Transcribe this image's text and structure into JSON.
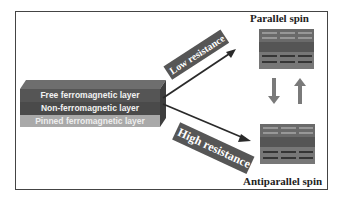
{
  "layers": {
    "free": "Free ferromagnetic layer",
    "non": "Non-ferromagnetic layer",
    "pinned": "Pinned ferromagnetic layer"
  },
  "paths": {
    "low": "Low resistance",
    "high": "High resistance"
  },
  "states": {
    "parallel": "Parallel spin",
    "antiparallel": "Antiparallel spin"
  },
  "colors": {
    "stack_dark": "#555555",
    "stack_mid": "#6a6a6a",
    "stack_light": "#a8a8a8",
    "band": "#565656",
    "arrow": "#2a2a2a",
    "switch_arrow": "#7a7a7a"
  }
}
